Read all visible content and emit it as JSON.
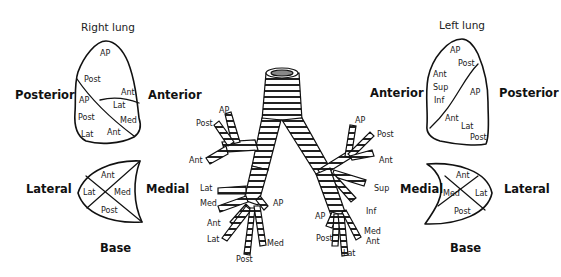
{
  "right_lung": {
    "title": "Right lung",
    "left_label": "Posterior",
    "right_label": "Anterior",
    "upper_lobe_segments": [
      "AP",
      "Post",
      "Ant"
    ],
    "middle_lobe_segments": [
      "Lat",
      "Med"
    ],
    "lower_lobe_segments": [
      "AP",
      "Post",
      "Lat",
      "Ant"
    ],
    "base": {
      "left_label": "Lateral",
      "right_label": "Medial",
      "bottom_label": "Base",
      "segments": [
        "Ant",
        "Lat",
        "Med",
        "Post"
      ]
    }
  },
  "left_lung": {
    "title": "Left lung",
    "left_label": "Anterior",
    "right_label": "Posterior",
    "upper_lobe_segments": [
      "AP",
      "Post",
      "Ant",
      "Sup",
      "Inf"
    ],
    "lower_lobe_segments": [
      "AP",
      "Ant",
      "Lat",
      "Post"
    ],
    "base": {
      "left_label": "Medial",
      "right_label": "Lateral",
      "bottom_label": "Base",
      "segments": [
        "Ant",
        "Med",
        "Lat",
        "Post"
      ]
    }
  },
  "bronchial_tree": {
    "right_upper": [
      "AP",
      "Post",
      "Ant"
    ],
    "right_middle": [
      "Lat",
      "Med"
    ],
    "right_lower": [
      "AP",
      "Ant",
      "Lat",
      "Post",
      "Med"
    ],
    "left_upper": [
      "AP",
      "Post",
      "Ant",
      "Sup",
      "Inf"
    ],
    "left_lower": [
      "AP",
      "Post",
      "Lat",
      "Med",
      "Ant"
    ]
  }
}
